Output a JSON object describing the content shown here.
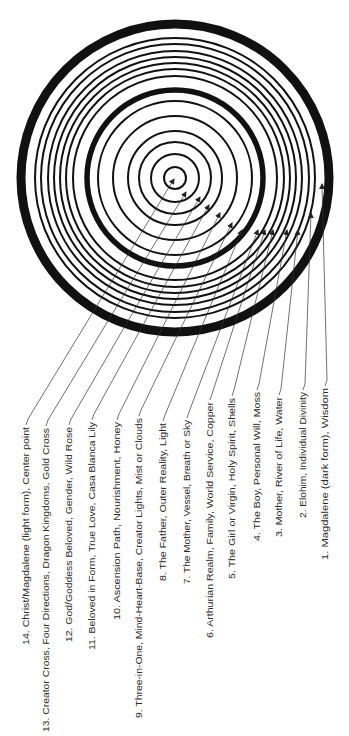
{
  "diagram": {
    "center": [
      175,
      178
    ],
    "colors": {
      "ink": "#111111",
      "text": "#2a2a2a",
      "background": "#ffffff"
    },
    "rings": [
      {
        "r": 154,
        "width": 9
      },
      {
        "r": 140,
        "width": 2
      },
      {
        "r": 134,
        "width": 2
      },
      {
        "r": 127,
        "width": 2
      },
      {
        "r": 121,
        "width": 2
      },
      {
        "r": 115,
        "width": 2
      },
      {
        "r": 109,
        "width": 2
      },
      {
        "r": 102,
        "width": 2
      },
      {
        "r": 88,
        "width": 5.5
      },
      {
        "r": 77,
        "width": 2
      },
      {
        "r": 62,
        "width": 2
      },
      {
        "r": 47,
        "width": 2
      },
      {
        "r": 36,
        "width": 2
      },
      {
        "r": 24,
        "width": 2
      },
      {
        "r": 11,
        "width": 2
      }
    ],
    "labels": [
      {
        "n": 14,
        "text": "14. Christ/Magdalene (light form), Center point",
        "x": 26,
        "top": 427,
        "bottom": 645,
        "tip": [
          174,
          179
        ]
      },
      {
        "n": 13,
        "text": "13. Creator Cross, Four Directions, Dragon Kingdoms, Gold Cross",
        "x": 46,
        "top": 428,
        "bottom": 732,
        "tip": [
          186,
          192
        ]
      },
      {
        "n": 12,
        "text": "12. God/Goddess Beloved, Gender, Wild Rose",
        "x": 69,
        "top": 427,
        "bottom": 642,
        "tip": [
          200,
          197
        ]
      },
      {
        "n": 11,
        "text": "11. Beloved in Form, True Love, Casa Blanca Lily",
        "x": 92,
        "top": 422,
        "bottom": 650,
        "tip": [
          209,
          205
        ]
      },
      {
        "n": 10,
        "text": "10. Ascension Path, Nourishment, Honey",
        "x": 117,
        "top": 422,
        "bottom": 620,
        "tip": [
          220,
          213
        ]
      },
      {
        "n": 9,
        "text": "9. Three-in-One, Mind-Heart-Base, Creator Lights, Mist or Clouds",
        "x": 139,
        "top": 418,
        "bottom": 718,
        "tip": [
          232,
          223
        ]
      },
      {
        "n": 8,
        "text": "8. The Father, Outer Reality, Light",
        "x": 163,
        "top": 423,
        "bottom": 581,
        "tip": [
          242,
          230
        ]
      },
      {
        "n": 7,
        "text": "7. The Mother, Vessel, Breath or Sky",
        "x": 187,
        "top": 420,
        "bottom": 584,
        "tip": [
          258,
          230
        ]
      },
      {
        "n": 6,
        "text": "6. Arthurian Realm, Family, World Service, Copper",
        "x": 210,
        "top": 402,
        "bottom": 638,
        "tip": [
          265,
          230
        ]
      },
      {
        "n": 5,
        "text": "5. The Girl or Virgin, Holy Spirit, Shells",
        "x": 232,
        "top": 398,
        "bottom": 579,
        "tip": [
          273,
          230
        ]
      },
      {
        "n": 4,
        "text": "4. The Boy, Personal Will, Moss",
        "x": 257,
        "top": 392,
        "bottom": 541,
        "tip": [
          287,
          230
        ]
      },
      {
        "n": 3,
        "text": "3. Mother, River of Life, Water",
        "x": 279,
        "top": 397,
        "bottom": 537,
        "tip": [
          298,
          230
        ]
      },
      {
        "n": 2,
        "text": "2. Elohim, Individual Divinity",
        "x": 303,
        "top": 392,
        "bottom": 518,
        "tip": [
          311,
          213
        ]
      },
      {
        "n": 1,
        "text": "1. Magdalene (dark form), Wisdom",
        "x": 325,
        "top": 388,
        "bottom": 560,
        "tip": [
          322,
          184
        ]
      }
    ]
  }
}
